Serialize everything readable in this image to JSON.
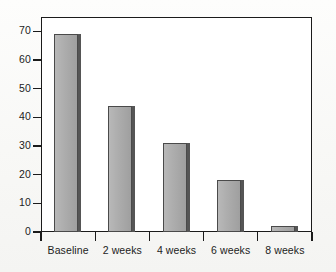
{
  "chart_data": {
    "type": "bar",
    "title": "",
    "xlabel": "",
    "ylabel": "",
    "categories": [
      "Baseline",
      "2 weeks",
      "4 weeks",
      "6 weeks",
      "8 weeks"
    ],
    "values": [
      69,
      44,
      31,
      18,
      2
    ],
    "ylim": [
      0,
      75
    ],
    "yticks": [
      0,
      10,
      20,
      30,
      40,
      50,
      60,
      70
    ],
    "ytick_labels": [
      "0",
      "10",
      "20",
      "30",
      "40",
      "50",
      "60",
      "70"
    ],
    "grid": false,
    "legend": null,
    "legend_position": "none",
    "bar_fill_color": "#a9a9a9",
    "bar_edge_color": "#4a4a4a",
    "bar_shadow_color": "#555555",
    "axis_color": "#1b1b1b",
    "plot_background": "#ffffff",
    "page_background": "#fbfbfa"
  },
  "axes": {
    "y": {
      "ticks": [
        {
          "label": "70",
          "value": 70
        },
        {
          "label": "60",
          "value": 60
        },
        {
          "label": "50",
          "value": 50
        },
        {
          "label": "40",
          "value": 40
        },
        {
          "label": "30",
          "value": 30
        },
        {
          "label": "20",
          "value": 20
        },
        {
          "label": "10",
          "value": 10
        },
        {
          "label": "0",
          "value": 0
        }
      ]
    },
    "x": {
      "ticks": [
        {
          "label": "Baseline"
        },
        {
          "label": "2 weeks"
        },
        {
          "label": "4 weeks"
        },
        {
          "label": "6 weeks"
        },
        {
          "label": "8 weeks"
        }
      ]
    }
  }
}
